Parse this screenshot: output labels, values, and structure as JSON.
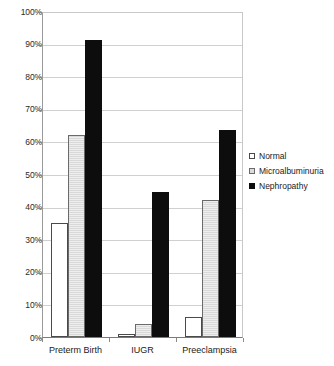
{
  "chart_data": {
    "type": "bar",
    "title": "",
    "xlabel": "",
    "ylabel": "",
    "ylim": [
      0,
      100
    ],
    "ytick_step": 10,
    "grid": true,
    "legend_position": "right",
    "categories": [
      "Preterm Birth",
      "IUGR",
      "Preeclampsia"
    ],
    "ytick_labels": [
      "0%",
      "10%",
      "20%",
      "30%",
      "40%",
      "50%",
      "60%",
      "70%",
      "80%",
      "90%",
      "100%"
    ],
    "ytick_values": [
      0,
      10,
      20,
      30,
      40,
      50,
      60,
      70,
      80,
      90,
      100
    ],
    "series": [
      {
        "name": "Normal",
        "key": "normal",
        "color": "#ffffff",
        "values": [
          35,
          1,
          6
        ]
      },
      {
        "name": "Microalbuminuria",
        "key": "micro",
        "color": "#d9d9d9",
        "values": [
          62,
          4,
          42
        ]
      },
      {
        "name": "Nephropathy",
        "key": "neph",
        "color": "#0d0d0d",
        "values": [
          91,
          44.5,
          63.5
        ]
      }
    ]
  },
  "legend": {
    "items": [
      {
        "label": "Normal",
        "swatch": "normal"
      },
      {
        "label": "Microalbuminuria",
        "swatch": "micro"
      },
      {
        "label": "Nephropathy",
        "swatch": "neph"
      }
    ]
  },
  "axis": {
    "y_max_label": "100%",
    "y_min_label": "0%"
  }
}
